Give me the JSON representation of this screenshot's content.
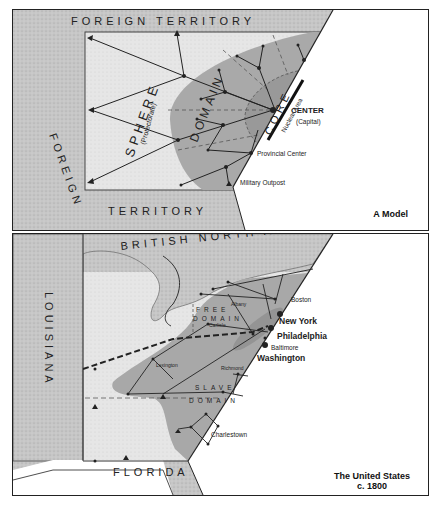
{
  "top_panel": {
    "caption": "A Model",
    "regions": {
      "foreign_top": "FOREIGN TERRITORY",
      "foreign_left": "FOREIGN",
      "foreign_bottom": "TERRITORY",
      "sphere": "SPHERE",
      "sphere_sub": "(Protectorate)",
      "domain": "DOMAIN",
      "core": "CORE",
      "nuclear_area": "Nuclear Area"
    },
    "labels": {
      "center": "CENTER",
      "center_sub": "(Capital)",
      "provincial_center": "Provincial Center",
      "military_outpost": "Military Outpost"
    }
  },
  "bottom_panel": {
    "caption_line1": "The United States",
    "caption_line2": "c. 1800",
    "regions": {
      "british_north_america": "BRITISH NORTH AMERICA",
      "louisiana": "LOUISIANA",
      "florida": "FLORIDA",
      "free_domain_1": "FREE",
      "free_domain_2": "DOMAIN",
      "slave_domain_1": "SLAVE",
      "slave_domain_2": "DOMAIN"
    },
    "cities": {
      "boston": "Boston",
      "new_york": "New York",
      "philadelphia": "Philadelphia",
      "baltimore": "Baltimore",
      "washington": "Washington",
      "albany": "Albany",
      "carlisle": "Carlisle",
      "lexington": "Lexington",
      "richmond": "Richmond",
      "charlestown": "Charlestown"
    }
  },
  "colors": {
    "foreign": "#c4c4c4",
    "sphere": "#e4e4e4",
    "domain": "#a8a8a8",
    "core": "#959595",
    "line": "#222222"
  }
}
